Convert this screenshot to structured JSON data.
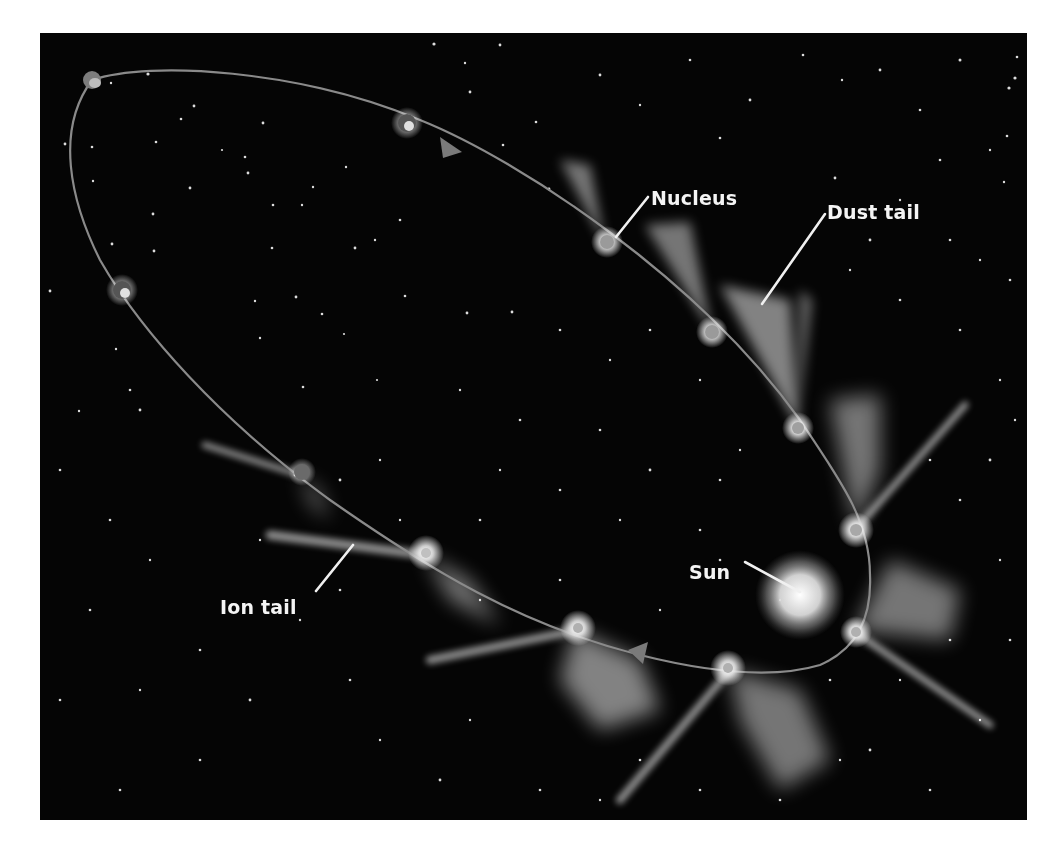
{
  "diagram": {
    "labels": {
      "nucleus": "Nucleus",
      "dust_tail": "Dust tail",
      "sun": "Sun",
      "ion_tail": "Ion tail"
    },
    "colors": {
      "background": "#050505",
      "orbit": "#8a8a8a",
      "label_text": "#f4f4f4",
      "page": "#ffffff"
    },
    "orbit_direction": "clockwise",
    "comet_positions_count": 12
  }
}
